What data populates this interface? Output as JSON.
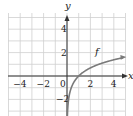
{
  "chart_data": {
    "type": "line",
    "title": "",
    "xlabel": "x",
    "ylabel": "y",
    "xlim": [
      -5,
      5
    ],
    "ylim": [
      -3.5,
      5.5
    ],
    "grid": true,
    "x_ticks": [
      -4,
      -2,
      0,
      2,
      4
    ],
    "x_tick_labels": [
      "−4",
      "−2",
      "0",
      "2",
      "4"
    ],
    "y_ticks": [
      -2,
      2,
      4
    ],
    "y_tick_labels": [
      "−2",
      "2",
      "4"
    ],
    "series": [
      {
        "name": "f",
        "label": "f",
        "function": "ln(x)",
        "x": [
          0.03,
          0.05,
          0.1,
          0.2,
          0.3,
          0.5,
          0.75,
          1,
          1.5,
          2,
          2.5,
          3,
          3.5,
          4,
          4.5,
          4.8
        ],
        "values": [
          -3.5,
          -3.0,
          -2.3,
          -1.61,
          -1.2,
          -0.69,
          -0.29,
          0,
          0.41,
          0.69,
          0.92,
          1.1,
          1.25,
          1.39,
          1.5,
          1.57
        ],
        "color": "#7a7a7a",
        "arrow_end": true
      }
    ],
    "annotations": [
      {
        "text": "f",
        "x": 2.4,
        "y": 1.8
      }
    ]
  },
  "colors": {
    "grid": "#cfcfcf",
    "axis": "#333333",
    "curve": "#7a7a7a"
  }
}
